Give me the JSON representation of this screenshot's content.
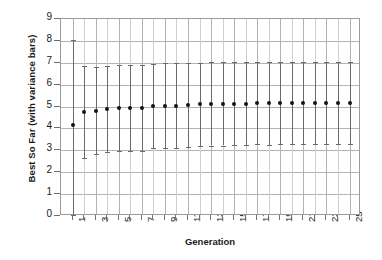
{
  "chart_data": {
    "type": "scatter",
    "title": "",
    "xlabel": "Generation",
    "ylabel": "Best So Far (with variance bars)",
    "xlim": [
      0,
      26
    ],
    "ylim": [
      0,
      9
    ],
    "ytick_labels": [
      "0",
      "1",
      "2",
      "3",
      "4",
      "5",
      "6",
      "7",
      "8",
      "9"
    ],
    "ytick_values": [
      0,
      1,
      2,
      3,
      4,
      5,
      6,
      7,
      8,
      9
    ],
    "xtick_labels": [
      "1",
      "3",
      "5",
      "7",
      "9",
      "11",
      "13",
      "15",
      "17",
      "19",
      "21",
      "23",
      "25"
    ],
    "x": [
      1,
      2,
      3,
      4,
      5,
      6,
      7,
      8,
      9,
      10,
      11,
      12,
      13,
      14,
      15,
      16,
      17,
      18,
      19,
      20,
      21,
      22,
      23,
      24,
      25
    ],
    "values": [
      4.15,
      4.75,
      4.82,
      4.88,
      4.93,
      4.95,
      4.95,
      5.02,
      5.05,
      5.05,
      5.07,
      5.1,
      5.12,
      5.12,
      5.13,
      5.14,
      5.15,
      5.15,
      5.16,
      5.16,
      5.17,
      5.17,
      5.18,
      5.18,
      5.18
    ],
    "err_upper": [
      8.05,
      6.85,
      6.8,
      6.85,
      6.9,
      6.92,
      6.92,
      6.95,
      6.98,
      6.98,
      7.0,
      7.0,
      7.02,
      7.02,
      7.02,
      7.03,
      7.03,
      7.04,
      7.04,
      7.04,
      7.05,
      7.05,
      7.05,
      7.05,
      7.05
    ],
    "err_lower": [
      0.05,
      2.65,
      2.84,
      2.91,
      2.96,
      2.98,
      2.98,
      3.09,
      3.12,
      3.12,
      3.14,
      3.2,
      3.22,
      3.22,
      3.24,
      3.25,
      3.27,
      3.26,
      3.28,
      3.28,
      3.29,
      3.29,
      3.31,
      3.31,
      3.31
    ],
    "grid": true,
    "legend": "none",
    "marker": "filled-circle",
    "marker_color": "#141414",
    "errorbar_color": "#6a6a6a",
    "gridline_color": "#b3b3b3",
    "frame_color": "#9b9b9b"
  }
}
